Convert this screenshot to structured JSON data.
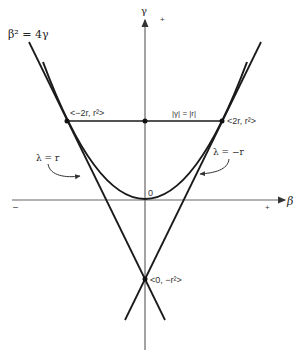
{
  "diagram": {
    "equation_label": "β² = 4γ",
    "axes": {
      "y_label": "γ",
      "x_label": "β",
      "y_plus": "+",
      "x_plus": "+",
      "x_minus": "–"
    },
    "origin_label": "0",
    "points": {
      "left_tangent": "<−2r, r²>",
      "right_tangent": "<2r, r²>",
      "intersection": "<0, −r²>"
    },
    "chord_label": "|γ| = |r|",
    "lines": {
      "left": "λ = r",
      "right": "λ = −r"
    },
    "colors": {
      "ink": "#1a1a1a",
      "axis": "#555555"
    }
  }
}
